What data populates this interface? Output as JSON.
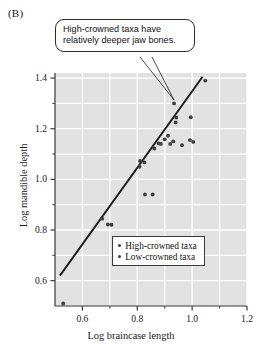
{
  "figure": {
    "panel_label": "(B)",
    "background_color": "#ffffff",
    "plot_background_color": "#e2e2e2",
    "gridline_color": "#ffffff",
    "axis_color": "#3a3a3a",
    "point_color": "#404040",
    "trendline_color": "#1a1a1a"
  },
  "callout": {
    "line1": "High-crowned taxa have",
    "line2": "relatively deeper jaw bones.",
    "border_color": "#2b2b2b",
    "background_color": "#ffffff",
    "points_to": {
      "x": 0.934,
      "y": 1.3
    }
  },
  "legend": {
    "position": "inside-bottom-right",
    "entries": [
      {
        "label": "High-crowned taxa",
        "marker": "dot",
        "color": "#404040"
      },
      {
        "label": "Low-crowned taxa",
        "marker": "dot",
        "color": "#404040"
      }
    ]
  },
  "chart_data": {
    "type": "scatter",
    "title": "",
    "xlabel": "Log braincase length",
    "ylabel": "Log mandible depth",
    "xlim": [
      0.5,
      1.2
    ],
    "ylim": [
      0.5,
      1.42
    ],
    "grid": true,
    "x_major_ticks": [
      0.6,
      0.8,
      1.0,
      1.2
    ],
    "x_major_tick_labels": [
      "0.6",
      "0.8",
      "1.0",
      "1.2"
    ],
    "x_minor_ticks": [
      0.5,
      0.7,
      0.9,
      1.1
    ],
    "y_major_ticks": [
      0.6,
      0.8,
      1.0,
      1.2,
      1.4
    ],
    "y_major_tick_labels": [
      "0.6",
      "0.8",
      "1.0",
      "1.2",
      "1.4"
    ],
    "y_minor_ticks": [
      0.7,
      0.9,
      1.1,
      1.3
    ],
    "series": [
      {
        "name": "High-crowned taxa",
        "marker": "dot",
        "color": "#404040",
        "points": [
          [
            0.53,
            0.51
          ],
          [
            0.672,
            0.845
          ],
          [
            0.693,
            0.822
          ],
          [
            0.706,
            0.821
          ],
          [
            0.828,
            0.94
          ],
          [
            0.856,
            0.94
          ],
          [
            0.808,
            1.05
          ],
          [
            0.81,
            1.073
          ],
          [
            0.826,
            1.067
          ],
          [
            0.862,
            1.122
          ],
          [
            0.878,
            1.142
          ],
          [
            0.886,
            1.14
          ],
          [
            0.9,
            1.158
          ],
          [
            0.912,
            1.172
          ],
          [
            0.92,
            1.14
          ],
          [
            0.931,
            1.15
          ],
          [
            0.934,
            1.3
          ],
          [
            0.94,
            1.225
          ],
          [
            0.942,
            1.244
          ],
          [
            0.963,
            1.135
          ],
          [
            0.992,
            1.155
          ],
          [
            0.995,
            1.245
          ],
          [
            1.004,
            1.148
          ],
          [
            1.048,
            1.39
          ]
        ]
      }
    ],
    "trendline": {
      "name": "regression line",
      "x_start": 0.518,
      "y_start": 0.62,
      "x_end": 1.038,
      "y_end": 1.405,
      "color": "#1a1a1a"
    }
  }
}
